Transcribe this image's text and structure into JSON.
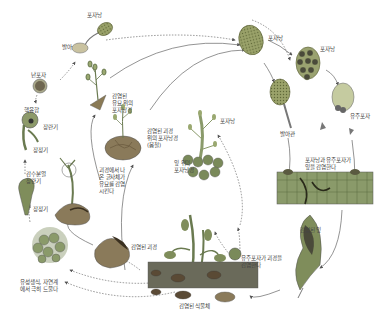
{
  "diagram": {
    "colors": {
      "background": "#ffffff",
      "sporangium_fill": "#8a9a5a",
      "sporangium_edge": "#6a7040",
      "tissue_green": "#6f8a4e",
      "tuber_brown": "#8b7a5a",
      "arrow": "#555555",
      "label_text": "#444444"
    },
    "labels": {
      "sporangium_top_left": "포자낭",
      "germination_top": "발아",
      "oospore": "난포자",
      "fertilization": "핵융합",
      "antheridium_1": "장란기",
      "oogonium_1": "장정기",
      "antheridium_enters": "감수분열\n장란기",
      "oogonium_2": "장정기",
      "sexual_reproduction": "유성생식, 자연계\n에서 극히 드물다",
      "sporangiophores_on_seedling": "감염된\n유묘 위의\n포자낭경",
      "sporangiophores_on_tuber": "감염된 괴경\n위의 포자낭경\n(봄철)",
      "mycelium_from_tuber": "괴경에서 나\n온 균사체가\n유묘를 감염\n시킨다",
      "infected_tuber_1": "감염된 괴경",
      "sporangiophores_on_leaf": "잎 위의\n포자낭경",
      "sporangium_label_stem": "포자낭",
      "sporangium_right_1": "포자낭",
      "sporangium_right_2": "포자낭",
      "zoospore": "유주포자",
      "germination_right": "발아관",
      "leaf_infection": "포자낭과 유주포자가\n잎을 감염한다",
      "infected_leaf": "감염된 잎",
      "zoospore_tuber_infection": "유주포자가 괴경을\n감염한다",
      "infected_plant": "감염된 식물체"
    }
  }
}
